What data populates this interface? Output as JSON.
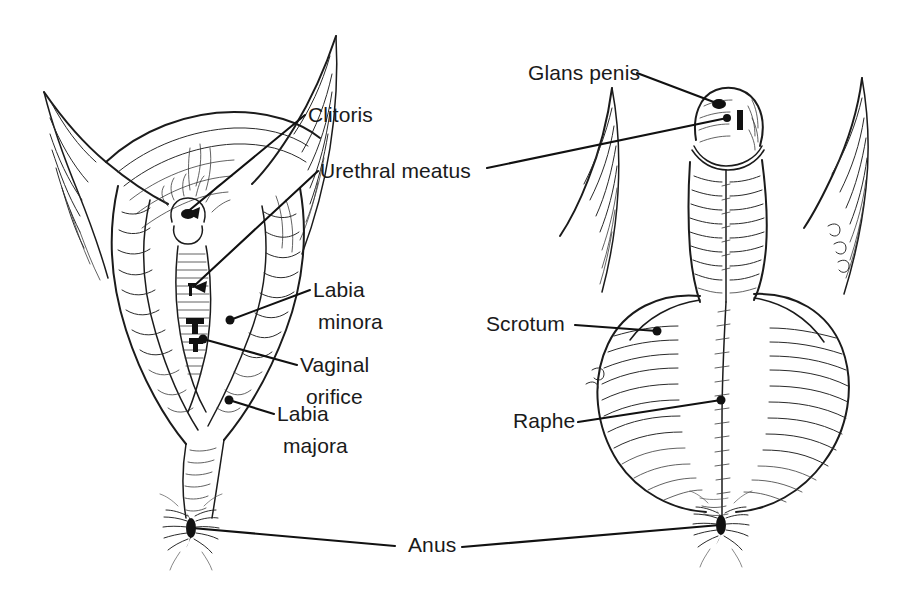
{
  "figure": {
    "background_color": "#ffffff",
    "ink_color": "#1b1b1b",
    "label_color": "#1a1a1a",
    "width": 906,
    "height": 594
  },
  "panels": [
    {
      "id": "female",
      "name": "female-external-genitalia",
      "position": "left"
    },
    {
      "id": "male",
      "name": "male-external-genitalia",
      "position": "right"
    }
  ],
  "labels": {
    "clitoris": {
      "text": "Clitoris",
      "x": 308,
      "y": 122,
      "panel": "female"
    },
    "urethral_meatus": {
      "text": "Urethral meatus",
      "x": 320,
      "y": 178,
      "panel": "female"
    },
    "labia_minora_line1": {
      "text": "Labia",
      "x": 313,
      "y": 297,
      "panel": "female"
    },
    "labia_minora_line2": {
      "text": "minora",
      "x": 318,
      "y": 329,
      "panel": "female"
    },
    "vaginal_orifice_line1": {
      "text": "Vaginal",
      "x": 300,
      "y": 372,
      "panel": "female"
    },
    "vaginal_orifice_line2": {
      "text": "orifice",
      "x": 306,
      "y": 404,
      "panel": "female"
    },
    "labia_majora_line1": {
      "text": "Labia",
      "x": 277,
      "y": 421,
      "panel": "female"
    },
    "labia_majora_line2": {
      "text": "majora",
      "x": 283,
      "y": 453,
      "panel": "female"
    },
    "glans_penis": {
      "text": "Glans penis",
      "x": 528,
      "y": 80,
      "panel": "male"
    },
    "scrotum": {
      "text": "Scrotum",
      "x": 486,
      "y": 331,
      "panel": "male"
    },
    "raphe": {
      "text": "Raphe",
      "x": 513,
      "y": 428,
      "panel": "male"
    },
    "anus": {
      "text": "Anus",
      "x": 408,
      "y": 552,
      "panel": "both"
    }
  },
  "leaders": [
    {
      "name": "clitoris-leader",
      "label": "Clitoris",
      "from": [
        305,
        115
      ],
      "to": [
        186,
        213
      ],
      "tip": "arrow"
    },
    {
      "name": "urethral-meatus-leader",
      "label": "Urethral meatus",
      "from": [
        318,
        171
      ],
      "to": [
        193,
        287
      ],
      "tip": "arrow"
    },
    {
      "name": "labia-minora-leader",
      "label": "Labia minora",
      "from": [
        310,
        290
      ],
      "to": [
        230,
        320
      ],
      "tip": "dot"
    },
    {
      "name": "vaginal-orifice-leader",
      "label": "Vaginal orifice",
      "from": [
        297,
        365
      ],
      "to": [
        203,
        339
      ],
      "tip": "dot"
    },
    {
      "name": "labia-majora-leader",
      "label": "Labia majora",
      "from": [
        274,
        414
      ],
      "to": [
        229,
        400
      ],
      "tip": "dot"
    },
    {
      "name": "glans-penis-leader",
      "label": "Glans penis",
      "from": [
        637,
        73
      ],
      "to": [
        719,
        104
      ],
      "tip": "dot"
    },
    {
      "name": "urethral-meatus-male-leader",
      "label": "Urethral meatus",
      "from": [
        487,
        168
      ],
      "to": [
        727,
        118
      ],
      "tip": "dot"
    },
    {
      "name": "scrotum-leader",
      "label": "Scrotum",
      "from": [
        575,
        325
      ],
      "to": [
        657,
        331
      ],
      "tip": "dot"
    },
    {
      "name": "raphe-leader",
      "label": "Raphe",
      "from": [
        578,
        422
      ],
      "to": [
        721,
        400
      ],
      "tip": "dot"
    },
    {
      "name": "anus-leader-left",
      "label": "Anus",
      "from": [
        395,
        546
      ],
      "to": [
        192,
        528
      ],
      "tip": "plain"
    },
    {
      "name": "anus-leader-right",
      "label": "Anus",
      "from": [
        462,
        547
      ],
      "to": [
        720,
        525
      ],
      "tip": "plain"
    }
  ]
}
